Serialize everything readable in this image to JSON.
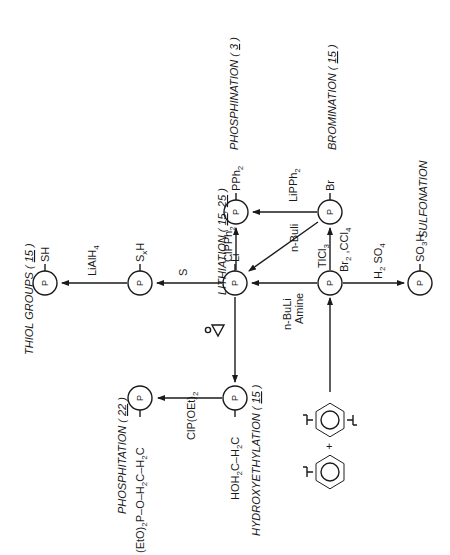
{
  "diagram": {
    "orientation": "rotated 90deg counter-clockwise",
    "colors": {
      "ink": "#1a1a1a",
      "background": "#ffffff"
    },
    "polymer_symbol": "P",
    "nodes": {
      "center": {
        "label": "P"
      },
      "lithio": {
        "group": "Li"
      },
      "phosphino": {
        "group": "PPh2"
      },
      "bromo": {
        "group": "Br"
      },
      "sulfo": {
        "group": "SO3H"
      },
      "polysulfide": {
        "group": "SxH"
      },
      "thiol": {
        "group": "SH"
      },
      "hydroxyethyl": {
        "group": "HOH2C-H2C"
      },
      "phosphitate": {
        "group": "(EtO)2P-O-H2C-H2C"
      },
      "monomers": {
        "a": "divinylbenzene",
        "b": "styrene",
        "plus": "+"
      }
    },
    "reagents": {
      "center_to_lithio": [
        "n-BuLi",
        "Amine"
      ],
      "center_to_bromo": [
        "TlCl3",
        "Br2 , CCl4"
      ],
      "center_to_sulfo": "H2 SO4",
      "bromo_to_lithio": "n-BuLi",
      "bromo_to_phosphino": "LiPPh2",
      "lithio_to_phosphino": "ClPPh2",
      "lithio_to_polysulfide": "S",
      "polysulfide_to_thiol": "LiAlH4",
      "lithio_to_hydroxyethyl": "ethylene oxide",
      "hydroxyethyl_to_phosphitate": "ClP(OEt)2"
    },
    "process_labels": {
      "phosphination": {
        "name": "PHOSPHINATION",
        "ref": "3"
      },
      "bromination": {
        "name": "BROMINATION",
        "ref": "15"
      },
      "sulfonation": {
        "name": "SULFONATION"
      },
      "lithiation": {
        "name": "LITHIATION",
        "refs": "15, 25"
      },
      "thiol_groups": {
        "name": "THIOL GROUPS",
        "ref": "15"
      },
      "hydroxyethylation": {
        "name": "HYDROXYETHYLATION",
        "ref": "15"
      },
      "phosphitation": {
        "name": "PHOSPHITATION",
        "ref": "22"
      }
    }
  }
}
